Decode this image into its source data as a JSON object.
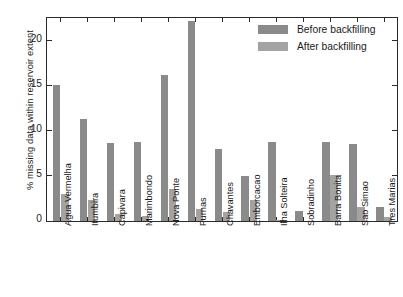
{
  "chart_data": {
    "type": "bar",
    "title": "",
    "xlabel": "",
    "ylabel": "% missing data within reservoir extent",
    "ylim": [
      0,
      22.5
    ],
    "yticks": [
      0,
      5,
      10,
      15,
      20
    ],
    "grid": false,
    "legend_position": "top-right",
    "categories": [
      "Agua Vermelha",
      "Itumbira",
      "Capivara",
      "Marimbondo",
      "Nova Ponte",
      "Furnas",
      "Chavantes",
      "Emborcacao",
      "Ilha Solteira",
      "Sobradinho",
      "Barra Bonita",
      "Sao Simao",
      "Tres Marias"
    ],
    "series": [
      {
        "name": "Before backfilling",
        "color": "#8a8a8a",
        "values": [
          15.1,
          11.35,
          8.65,
          8.8,
          16.2,
          22.15,
          8.0,
          5.0,
          8.8,
          1.15,
          8.75,
          8.5,
          1.5
        ]
      },
      {
        "name": "After backfilling",
        "color": "#a3a3a3",
        "values": [
          3.0,
          2.35,
          0.8,
          0.6,
          3.55,
          1.35,
          0.95,
          2.35,
          0.1,
          0.0,
          5.05,
          1.5,
          0.45
        ]
      }
    ]
  },
  "axis": {
    "frame_color": "#2b2b2b"
  }
}
